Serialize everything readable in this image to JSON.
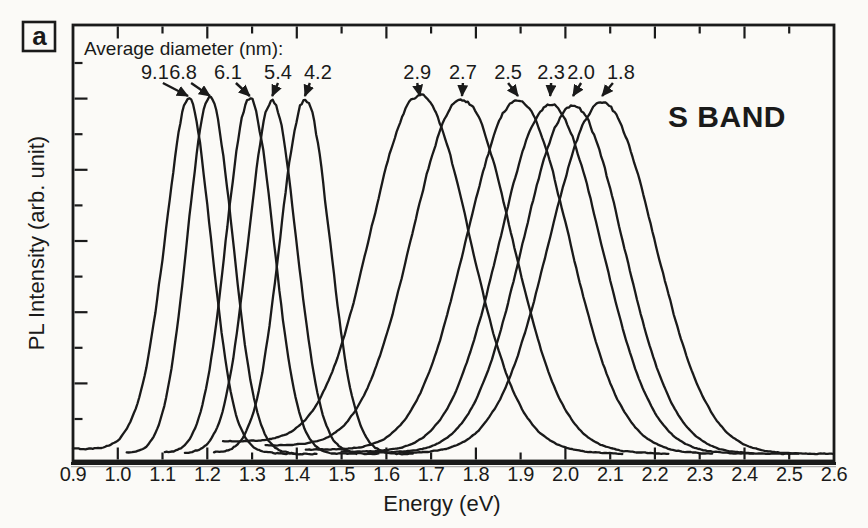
{
  "figure": {
    "panel_label": "a",
    "band_label": "S BAND",
    "annotation_title": "Average diameter (nm):",
    "xlabel": "Energy (eV)",
    "ylabel": "PL Intensity (arb. unit)"
  },
  "colors": {
    "ink": "#1a1a1a",
    "paper": "#fbfaf7"
  },
  "chart_data": {
    "type": "line",
    "xlabel": "Energy (eV)",
    "ylabel": "PL Intensity (arb. unit)",
    "xlim": [
      0.9,
      2.6
    ],
    "x_tick_labels": [
      "0.9",
      "1.0",
      "1.1",
      "1.2",
      "1.3",
      "1.4",
      "1.5",
      "1.6",
      "1.7",
      "1.8",
      "1.9",
      "2.0",
      "2.1",
      "2.2",
      "2.3",
      "2.4",
      "2.5",
      "2.6"
    ],
    "y_ticks_labeled": false,
    "grid": false,
    "annotation": "Average diameter (nm):",
    "band_label": "S BAND",
    "panel_label": "a",
    "legend_position": "none",
    "series": [
      {
        "diameter_nm": "9.1",
        "peak_eV": 1.157,
        "fwhm_eV": 0.12,
        "rel_intensity": 1.0,
        "label_eV": 1.083,
        "range_eV": [
          0.9,
          1.4
        ],
        "base": 0.02,
        "noise": 0.022,
        "left_exp": 1.75
      },
      {
        "diameter_nm": "6.8",
        "peak_eV": 1.206,
        "fwhm_eV": 0.12,
        "rel_intensity": 1.0,
        "label_eV": 1.146,
        "range_eV": [
          1.02,
          1.445
        ],
        "base": 0.008,
        "noise": 0.022,
        "left_exp": 2
      },
      {
        "diameter_nm": "6.1",
        "peak_eV": 1.295,
        "fwhm_eV": 0.125,
        "rel_intensity": 1.0,
        "label_eV": 1.246,
        "range_eV": [
          1.105,
          1.535
        ],
        "base": 0.008,
        "noise": 0.022,
        "left_exp": 2
      },
      {
        "diameter_nm": "5.4",
        "peak_eV": 1.345,
        "fwhm_eV": 0.127,
        "rel_intensity": 0.995,
        "label_eV": 1.358,
        "range_eV": [
          1.15,
          1.585
        ],
        "base": 0.008,
        "noise": 0.022,
        "left_exp": 2
      },
      {
        "diameter_nm": "4.2",
        "peak_eV": 1.418,
        "fwhm_eV": 0.13,
        "rel_intensity": 1.0,
        "label_eV": 1.447,
        "range_eV": [
          1.215,
          1.66
        ],
        "base": 0.01,
        "noise": 0.027,
        "left_exp": 2
      },
      {
        "diameter_nm": "2.9",
        "peak_eV": 1.675,
        "fwhm_eV": 0.26,
        "rel_intensity": 0.995,
        "label_eV": 1.669,
        "range_eV": [
          1.235,
          2.13
        ],
        "base": 0.042,
        "noise": 0.013,
        "left_exp": 2
      },
      {
        "diameter_nm": "2.7",
        "peak_eV": 1.769,
        "fwhm_eV": 0.264,
        "rel_intensity": 0.99,
        "label_eV": 1.771,
        "range_eV": [
          1.33,
          2.23
        ],
        "base": 0.03,
        "noise": 0.013,
        "left_exp": 2
      },
      {
        "diameter_nm": "2.5",
        "peak_eV": 1.894,
        "fwhm_eV": 0.27,
        "rel_intensity": 0.995,
        "label_eV": 1.872,
        "range_eV": [
          1.42,
          2.33
        ],
        "base": 0.018,
        "noise": 0.013,
        "left_exp": 2
      },
      {
        "diameter_nm": "2.3",
        "peak_eV": 1.966,
        "fwhm_eV": 0.266,
        "rel_intensity": 0.985,
        "label_eV": 1.968,
        "range_eV": [
          1.5,
          2.42
        ],
        "base": 0.012,
        "noise": 0.013,
        "left_exp": 2
      },
      {
        "diameter_nm": "2.0",
        "peak_eV": 2.017,
        "fwhm_eV": 0.264,
        "rel_intensity": 0.98,
        "label_eV": 2.035,
        "range_eV": [
          1.56,
          2.52
        ],
        "base": 0.01,
        "noise": 0.013,
        "left_exp": 2
      },
      {
        "diameter_nm": "1.8",
        "peak_eV": 2.082,
        "fwhm_eV": 0.278,
        "rel_intensity": 0.99,
        "label_eV": 2.124,
        "range_eV": [
          1.63,
          2.6
        ],
        "base": 0.008,
        "noise": 0.014,
        "left_exp": 2
      }
    ]
  }
}
